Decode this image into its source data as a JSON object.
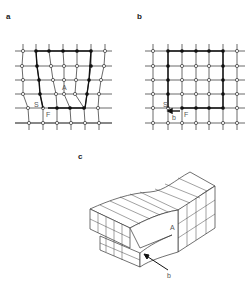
{
  "panels": {
    "a": {
      "label": "a",
      "markers": {
        "A": "A",
        "S": "S",
        "F": "F"
      }
    },
    "b": {
      "label": "b",
      "markers": {
        "S": "S",
        "F": "F",
        "burgers": "b"
      }
    },
    "c": {
      "label": "c",
      "markers": {
        "A": "A",
        "burgers": "b"
      }
    }
  },
  "colors": {
    "line": "#333333",
    "node_fill": "#ffffff",
    "circuit": "#111111"
  }
}
